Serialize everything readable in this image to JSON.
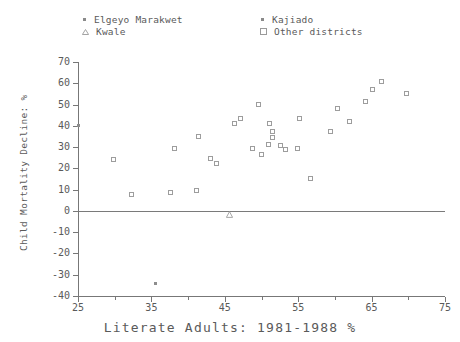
{
  "chart_data": {
    "type": "scatter",
    "title": "",
    "xlabel": "Literate Adults: 1981-1988 %",
    "ylabel": "Child Mortality Decline: %",
    "xlim": [
      25,
      75
    ],
    "ylim": [
      -40,
      70
    ],
    "xticks": [
      25,
      35,
      45,
      55,
      65,
      75
    ],
    "yticks": [
      70,
      60,
      50,
      40,
      30,
      20,
      10,
      0,
      -10,
      -20,
      -30,
      -40
    ],
    "xtick_labels": [
      "25",
      "35",
      "45",
      "55",
      "65",
      "75"
    ],
    "ytick_labels": [
      "70",
      "60",
      "50",
      "40",
      "30",
      "20",
      "10",
      "0",
      "-10",
      "-20",
      "-30",
      "-40"
    ],
    "x_minor_step": 5,
    "grid": false,
    "reference_lines": [
      {
        "axis": "y",
        "value": 0
      }
    ],
    "legend_position": "top",
    "marker_color": "#9d9d9d",
    "series": [
      {
        "name": "Elgeyo Marakwet",
        "marker": "dot",
        "points": [
          {
            "x": 25.0,
            "y": 40.0
          }
        ]
      },
      {
        "name": "Kajiado",
        "marker": "dot",
        "points": [
          {
            "x": 35.6,
            "y": -34.0
          }
        ]
      },
      {
        "name": "Kwale",
        "marker": "triangle",
        "points": [
          {
            "x": 45.7,
            "y": 2.0
          }
        ]
      },
      {
        "name": "Other districts",
        "marker": "square",
        "points": [
          {
            "x": 29.9,
            "y": 23.8
          },
          {
            "x": 32.3,
            "y": 7.6
          },
          {
            "x": 37.7,
            "y": 8.4
          },
          {
            "x": 38.2,
            "y": 29.2
          },
          {
            "x": 41.2,
            "y": 9.4
          },
          {
            "x": 41.5,
            "y": 34.9
          },
          {
            "x": 43.1,
            "y": 24.6
          },
          {
            "x": 44.0,
            "y": 22.0
          },
          {
            "x": 46.4,
            "y": 41.0
          },
          {
            "x": 47.2,
            "y": 43.0
          },
          {
            "x": 48.9,
            "y": 29.0
          },
          {
            "x": 50.0,
            "y": 26.5
          },
          {
            "x": 49.6,
            "y": 50.0
          },
          {
            "x": 51.2,
            "y": 41.0
          },
          {
            "x": 51.5,
            "y": 37.0
          },
          {
            "x": 51.6,
            "y": 34.5
          },
          {
            "x": 51.0,
            "y": 31.0
          },
          {
            "x": 52.6,
            "y": 30.5
          },
          {
            "x": 53.4,
            "y": 28.4
          },
          {
            "x": 55.0,
            "y": 29.0
          },
          {
            "x": 55.3,
            "y": 43.0
          },
          {
            "x": 56.8,
            "y": 15.0
          },
          {
            "x": 59.5,
            "y": 37.0
          },
          {
            "x": 60.4,
            "y": 48.0
          },
          {
            "x": 62.1,
            "y": 42.0
          },
          {
            "x": 64.3,
            "y": 51.0
          },
          {
            "x": 65.2,
            "y": 57.0
          },
          {
            "x": 66.4,
            "y": 60.5
          },
          {
            "x": 69.8,
            "y": 55.0
          }
        ]
      }
    ]
  },
  "legend": {
    "entries": [
      {
        "label": "Elgeyo Marakwet",
        "marker": "dot"
      },
      {
        "label": "Kwale",
        "marker": "triangle"
      },
      {
        "label": "Kajiado",
        "marker": "dot"
      },
      {
        "label": "Other districts",
        "marker": "square"
      }
    ]
  }
}
